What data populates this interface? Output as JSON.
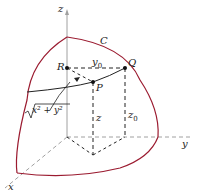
{
  "diagram": {
    "labels": {
      "z_axis": "z",
      "y_axis": "y",
      "x_axis": "x",
      "curve": "C",
      "point_r": "R",
      "point_q": "Q",
      "point_p": "P",
      "y0": "y",
      "y0_sub": "0",
      "z": "z",
      "z0": "z",
      "z0_sub": "0",
      "sqrt_expr": "x² + y²"
    },
    "colors": {
      "surface_edge": "#9b1b30",
      "axes": "#a0a0a0",
      "lines": "#222222"
    }
  }
}
